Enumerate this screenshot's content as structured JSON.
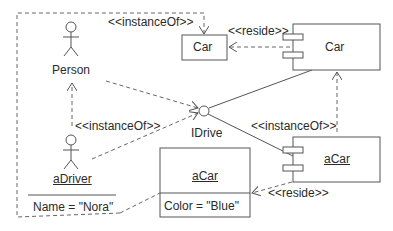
{
  "diagram": {
    "type": "UML deployment/component instance diagram",
    "actors": [
      {
        "id": "person",
        "label": "Person",
        "underlined": false
      },
      {
        "id": "aDriver",
        "label": "aDriver",
        "underlined": true,
        "attribute": "Name = \"Nora\""
      }
    ],
    "classes": [
      {
        "id": "carClass",
        "label": "Car"
      }
    ],
    "components": [
      {
        "id": "carComponent",
        "label": "Car",
        "underlined": false
      },
      {
        "id": "aCarComponent",
        "label": "aCar",
        "underlined": true
      }
    ],
    "objects": [
      {
        "id": "aCarObject",
        "label": "aCar",
        "underlined": true,
        "attribute": "Color = \"Blue\""
      }
    ],
    "interfaces": [
      {
        "id": "iDrive",
        "label": "IDrive"
      }
    ],
    "relations": [
      {
        "from": "aDriver",
        "to": "carClass",
        "type": "dependency",
        "label": "<<instanceOf>>"
      },
      {
        "from": "carComponent",
        "to": "carClass",
        "type": "dependency",
        "label": "<<reside>>"
      },
      {
        "from": "aDriver",
        "to": "person",
        "type": "dependency",
        "label": "<<instanceOf>>"
      },
      {
        "from": "person",
        "to": "iDrive",
        "type": "dependency",
        "label": ""
      },
      {
        "from": "aDriver",
        "to": "iDrive",
        "type": "dependency",
        "label": ""
      },
      {
        "from": "carComponent",
        "to": "iDrive",
        "type": "realization",
        "label": ""
      },
      {
        "from": "aCarComponent",
        "to": "iDrive",
        "type": "realization",
        "label": ""
      },
      {
        "from": "aCarComponent",
        "to": "carComponent",
        "type": "dependency",
        "label": "<<instanceOf>>"
      },
      {
        "from": "aCarComponent",
        "to": "aCarObject",
        "type": "dependency",
        "label": "<<reside>>"
      },
      {
        "from": "aDriver",
        "to": "aCarObject",
        "type": "link",
        "label": ""
      }
    ],
    "labels": {
      "instanceOf_top": "<<instanceOf>>",
      "reside_top": "<<reside>>",
      "instanceOf_left": "<<instanceOf>>",
      "instanceOf_right": "<<instanceOf>>",
      "reside_bottom": "<<reside>>"
    }
  }
}
